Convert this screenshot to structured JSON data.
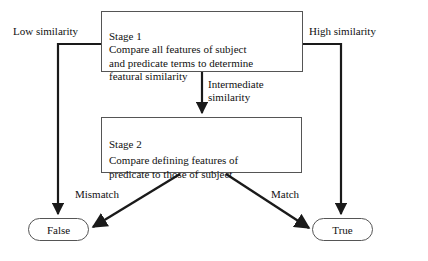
{
  "diagram": {
    "stroke_color": "#1a1a1a",
    "box_border_color": "#555555",
    "background": "#ffffff",
    "nodes": [
      {
        "id": "stage1",
        "name": "stage-1-box",
        "heading": "Stage 1",
        "body": "Compare all features of subject\nand predicate terms to determine\nfeatural similarity"
      },
      {
        "id": "stage2",
        "name": "stage-2-box",
        "heading": "Stage 2",
        "body": "Compare defining features of\npredicate to those of subject"
      }
    ],
    "terminals": [
      {
        "id": "false",
        "label": "False"
      },
      {
        "id": "true",
        "label": "True"
      }
    ],
    "edge_labels": [
      {
        "id": "low",
        "text": "Low similarity"
      },
      {
        "id": "high",
        "text": "High similarity"
      },
      {
        "id": "intermediate",
        "text": "Intermediate\nsimilarity"
      },
      {
        "id": "mismatch",
        "text": "Mismatch"
      },
      {
        "id": "match",
        "text": "Match"
      }
    ]
  }
}
